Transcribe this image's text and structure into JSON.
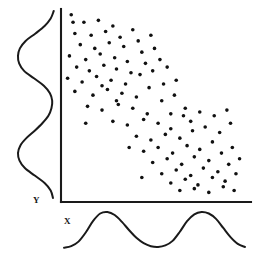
{
  "figure": {
    "background_color": "#ffffff",
    "ink_color": "#1a1a1a",
    "dot_color": "#111111",
    "width": 260,
    "height": 261
  },
  "axes": {
    "x_label": "X",
    "y_label": "Y",
    "origin": {
      "x": 61,
      "y": 202
    },
    "x_axis_end": {
      "x": 251,
      "y": 202
    },
    "y_axis_top": {
      "x": 61,
      "y": 9
    },
    "ticks": [],
    "grid": false
  },
  "chart_data": {
    "type": "scatter",
    "xlabel": "X",
    "ylabel": "Y",
    "xlim": [
      0,
      100
    ],
    "ylim": [
      0,
      100
    ],
    "grid": false,
    "legend": "none",
    "annotations": [
      "Negative association between X and Y",
      "Both marginal distributions are bimodal",
      "Two dense clusters along the descending diagonal"
    ],
    "marginal_x": {
      "type": "line",
      "position": "bottom",
      "modality": "bimodal",
      "peaks_x": [
        18,
        74
      ],
      "x": [
        0,
        4,
        8,
        12,
        16,
        20,
        24,
        28,
        32,
        36,
        40,
        44,
        48,
        52,
        56,
        60,
        64,
        68,
        72,
        76,
        80,
        84,
        88,
        92,
        96,
        100
      ],
      "y": [
        6,
        10,
        22,
        46,
        76,
        96,
        100,
        92,
        74,
        52,
        32,
        18,
        10,
        8,
        12,
        24,
        48,
        76,
        94,
        100,
        96,
        82,
        58,
        34,
        16,
        8
      ]
    },
    "marginal_y": {
      "type": "line",
      "position": "left",
      "modality": "bimodal",
      "peaks_y": [
        76,
        24
      ],
      "y": [
        0,
        4,
        8,
        12,
        16,
        20,
        24,
        28,
        32,
        36,
        40,
        44,
        48,
        52,
        56,
        60,
        64,
        68,
        72,
        76,
        80,
        84,
        88,
        92,
        96,
        100
      ],
      "x": [
        8,
        14,
        30,
        56,
        82,
        96,
        100,
        94,
        78,
        56,
        36,
        20,
        12,
        10,
        16,
        32,
        58,
        84,
        97,
        100,
        95,
        80,
        54,
        30,
        14,
        6
      ]
    },
    "points": [
      [
        4,
        98
      ],
      [
        11,
        94
      ],
      [
        19,
        95
      ],
      [
        27,
        92
      ],
      [
        6,
        88
      ],
      [
        15,
        87
      ],
      [
        23,
        89
      ],
      [
        31,
        86
      ],
      [
        38,
        90
      ],
      [
        9,
        82
      ],
      [
        17,
        80
      ],
      [
        25,
        83
      ],
      [
        33,
        81
      ],
      [
        41,
        84
      ],
      [
        48,
        87
      ],
      [
        3,
        76
      ],
      [
        12,
        74
      ],
      [
        20,
        77
      ],
      [
        28,
        75
      ],
      [
        35,
        73
      ],
      [
        43,
        78
      ],
      [
        50,
        80
      ],
      [
        7,
        70
      ],
      [
        14,
        68
      ],
      [
        22,
        71
      ],
      [
        29,
        69
      ],
      [
        37,
        67
      ],
      [
        45,
        72
      ],
      [
        53,
        74
      ],
      [
        2,
        64
      ],
      [
        10,
        62
      ],
      [
        18,
        65
      ],
      [
        26,
        63
      ],
      [
        34,
        61
      ],
      [
        42,
        66
      ],
      [
        49,
        68
      ],
      [
        57,
        70
      ],
      [
        6,
        57
      ],
      [
        16,
        55
      ],
      [
        24,
        58
      ],
      [
        32,
        56
      ],
      [
        40,
        54
      ],
      [
        47,
        59
      ],
      [
        55,
        61
      ],
      [
        62,
        63
      ],
      [
        13,
        49
      ],
      [
        21,
        47
      ],
      [
        30,
        50
      ],
      [
        38,
        48
      ],
      [
        46,
        45
      ],
      [
        54,
        52
      ],
      [
        61,
        55
      ],
      [
        27,
        41
      ],
      [
        35,
        39
      ],
      [
        44,
        42
      ],
      [
        52,
        40
      ],
      [
        59,
        37
      ],
      [
        66,
        44
      ],
      [
        40,
        33
      ],
      [
        48,
        31
      ],
      [
        56,
        34
      ],
      [
        64,
        32
      ],
      [
        71,
        36
      ],
      [
        44,
        25
      ],
      [
        52,
        27
      ],
      [
        60,
        24
      ],
      [
        68,
        28
      ],
      [
        75,
        26
      ],
      [
        82,
        30
      ],
      [
        49,
        19
      ],
      [
        57,
        21
      ],
      [
        65,
        18
      ],
      [
        72,
        22
      ],
      [
        80,
        20
      ],
      [
        87,
        24
      ],
      [
        93,
        27
      ],
      [
        54,
        13
      ],
      [
        62,
        15
      ],
      [
        70,
        12
      ],
      [
        77,
        16
      ],
      [
        85,
        14
      ],
      [
        91,
        18
      ],
      [
        97,
        21
      ],
      [
        59,
        8
      ],
      [
        67,
        10
      ],
      [
        74,
        7
      ],
      [
        82,
        11
      ],
      [
        89,
        9
      ],
      [
        95,
        13
      ],
      [
        64,
        4
      ],
      [
        72,
        5
      ],
      [
        80,
        3
      ],
      [
        88,
        6
      ],
      [
        94,
        4
      ],
      [
        36,
        27
      ],
      [
        43,
        11
      ],
      [
        70,
        41
      ],
      [
        78,
        38
      ],
      [
        86,
        35
      ],
      [
        92,
        40
      ],
      [
        59,
        45
      ],
      [
        67,
        48
      ],
      [
        75,
        46
      ],
      [
        83,
        44
      ],
      [
        90,
        47
      ],
      [
        21,
        60
      ],
      [
        29,
        52
      ],
      [
        12,
        40
      ],
      [
        5,
        94
      ]
    ],
    "point_count": 110,
    "marker": {
      "shape": "circle",
      "size_px": 3.6,
      "color": "#111111"
    }
  },
  "marginal_labels": {
    "x_curve_name": "x-marginal-density",
    "y_curve_name": "y-marginal-density"
  },
  "icons": {
    "y_axis_icon": "vertical-axis-line",
    "x_axis_icon": "horizontal-axis-line"
  }
}
